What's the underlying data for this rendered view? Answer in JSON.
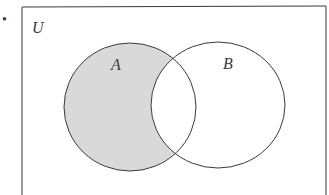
{
  "diagram": {
    "type": "venn",
    "bullet": "•",
    "universe_label": "U",
    "sets": [
      {
        "name": "A",
        "label": "A"
      },
      {
        "name": "B",
        "label": "B"
      }
    ],
    "shaded_region": "A only (A minus B)",
    "colors": {
      "stroke": "#3a3a3a",
      "shade": "#d9d9d9",
      "background": "#ffffff"
    }
  }
}
